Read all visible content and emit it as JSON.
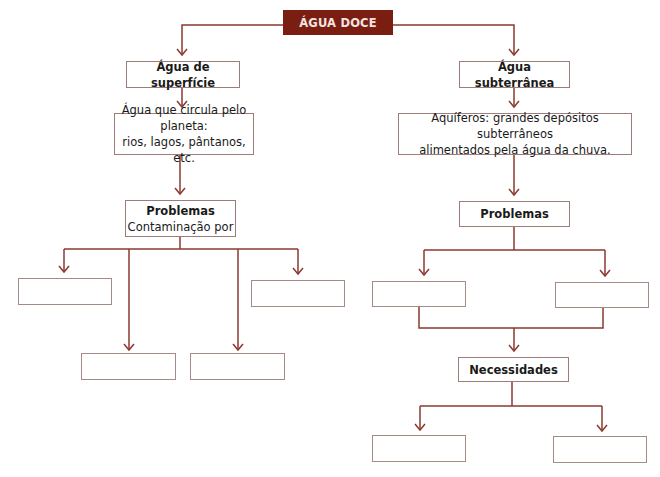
{
  "diagram": {
    "title": "ÁGUA DOCE",
    "colors": {
      "accent": "#7a1e12",
      "line": "#8b3a2f",
      "box_border": "#9d7d79"
    },
    "left_branch": {
      "heading": "Água de superfície",
      "description_line1": "Água que circula pelo planeta:",
      "description_line2": "rios, lagos, pântanos, etc.",
      "problems": {
        "heading": "Problemas",
        "subtitle": "Contaminação por",
        "blanks": [
          "",
          "",
          "",
          ""
        ]
      }
    },
    "right_branch": {
      "heading": "Água subterrânea",
      "description_line1": "Aquíferos: grandes depósitos subterrâneos",
      "description_line2": "alimentados pela água da chuva.",
      "problems": {
        "heading": "Problemas",
        "blanks": [
          "",
          ""
        ]
      },
      "needs": {
        "heading": "Necessidades",
        "blanks": [
          "",
          ""
        ]
      }
    }
  }
}
